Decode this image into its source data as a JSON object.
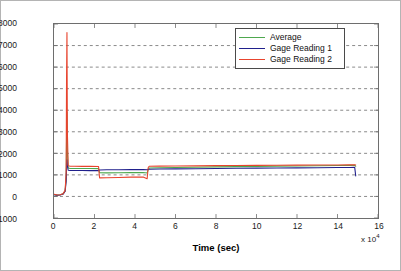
{
  "chart_data": {
    "type": "line",
    "title": "",
    "xlabel": "Time (sec)",
    "ylabel": "uStrain",
    "x_multiplier": "x 10",
    "x_multiplier_exp": "4",
    "xlim": [
      0,
      16
    ],
    "ylim": [
      -1000,
      8000
    ],
    "xticks": [
      0,
      2,
      4,
      6,
      8,
      10,
      12,
      14,
      16
    ],
    "yticks": [
      -1000,
      0,
      1000,
      2000,
      3000,
      4000,
      5000,
      6000,
      7000,
      8000
    ],
    "grid": true,
    "grid_style": "dashed",
    "legend_position": "top-right",
    "x_units_note": "x values are in units of 10^4 seconds",
    "series": [
      {
        "name": "Average",
        "color": "#4EA84E",
        "x": [
          0,
          0.15,
          0.3,
          0.45,
          0.55,
          0.6,
          0.62,
          0.64,
          0.66,
          0.7,
          0.8,
          1.0,
          1.4,
          1.8,
          2.2,
          2.25,
          2.6,
          3.2,
          3.8,
          4.4,
          4.6,
          4.65,
          4.7,
          5.2,
          6.0,
          7.0,
          8.0,
          9.0,
          10.0,
          11.0,
          12.0,
          13.0,
          14.0,
          14.6,
          14.85,
          14.9
        ],
        "values": [
          90,
          60,
          75,
          120,
          260,
          900,
          2600,
          3900,
          2100,
          1320,
          1300,
          1300,
          1300,
          1295,
          1290,
          1100,
          1095,
          1100,
          1105,
          1110,
          1090,
          1230,
          1320,
          1330,
          1340,
          1355,
          1370,
          1385,
          1395,
          1405,
          1415,
          1425,
          1435,
          1442,
          1448,
          1400
        ]
      },
      {
        "name": "Gage Reading 1",
        "color": "#20208C",
        "x": [
          0,
          0.15,
          0.3,
          0.45,
          0.55,
          0.6,
          0.62,
          0.64,
          0.66,
          0.7,
          0.8,
          1.0,
          1.4,
          1.8,
          2.2,
          2.25,
          2.6,
          3.2,
          3.8,
          4.4,
          4.6,
          4.65,
          4.7,
          5.2,
          6.0,
          7.0,
          8.0,
          9.0,
          10.0,
          11.0,
          12.0,
          13.0,
          14.0,
          14.6,
          14.85,
          14.9
        ],
        "values": [
          80,
          55,
          70,
          110,
          240,
          700,
          1400,
          1700,
          1450,
          1215,
          1205,
          1200,
          1200,
          1198,
          1196,
          1230,
          1235,
          1240,
          1245,
          1250,
          1240,
          1255,
          1265,
          1270,
          1278,
          1288,
          1298,
          1305,
          1312,
          1318,
          1325,
          1332,
          1340,
          1345,
          1350,
          950
        ]
      },
      {
        "name": "Gage Reading 2",
        "color": "#E8442E",
        "x": [
          0,
          0.15,
          0.3,
          0.45,
          0.55,
          0.6,
          0.62,
          0.64,
          0.66,
          0.7,
          0.8,
          1.0,
          1.4,
          1.8,
          2.2,
          2.25,
          2.6,
          3.2,
          3.8,
          4.4,
          4.6,
          4.65,
          4.7,
          5.2,
          6.0,
          7.0,
          8.0,
          9.0,
          10.0,
          11.0,
          12.0,
          13.0,
          14.0,
          14.6,
          14.85,
          14.9
        ],
        "values": [
          100,
          65,
          80,
          130,
          280,
          1100,
          5500,
          7600,
          3000,
          1420,
          1400,
          1398,
          1396,
          1394,
          1392,
          860,
          865,
          880,
          895,
          905,
          820,
          1330,
          1400,
          1408,
          1412,
          1420,
          1428,
          1436,
          1442,
          1448,
          1452,
          1456,
          1460,
          1465,
          1470,
          1460
        ]
      }
    ],
    "annotations": {
      "peak": {
        "series": "Gage Reading 2",
        "x": 0.64,
        "value": 7600
      }
    }
  },
  "legend": {
    "entries": [
      {
        "label": "Average"
      },
      {
        "label": "Gage Reading 1"
      },
      {
        "label": "Gage Reading 2"
      }
    ]
  }
}
